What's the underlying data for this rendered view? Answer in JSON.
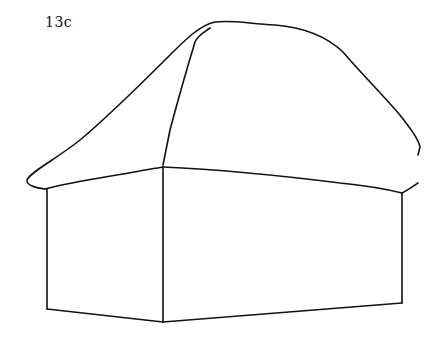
{
  "figure": {
    "label": "13c",
    "stroke_color": "#111111",
    "background": "#ffffff"
  }
}
